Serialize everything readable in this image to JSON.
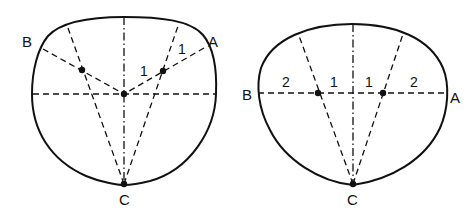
{
  "figures": [
    {
      "id": "left",
      "labels": {
        "a": "A",
        "b": "B",
        "c": "C"
      },
      "segment_labels": [
        "1",
        "1"
      ]
    },
    {
      "id": "right",
      "labels": {
        "a": "A",
        "b": "B",
        "c": "C"
      },
      "segment_labels": [
        "2",
        "1",
        "1",
        "2"
      ]
    }
  ],
  "colors": {
    "stroke": "#111111",
    "background": "#ffffff"
  }
}
